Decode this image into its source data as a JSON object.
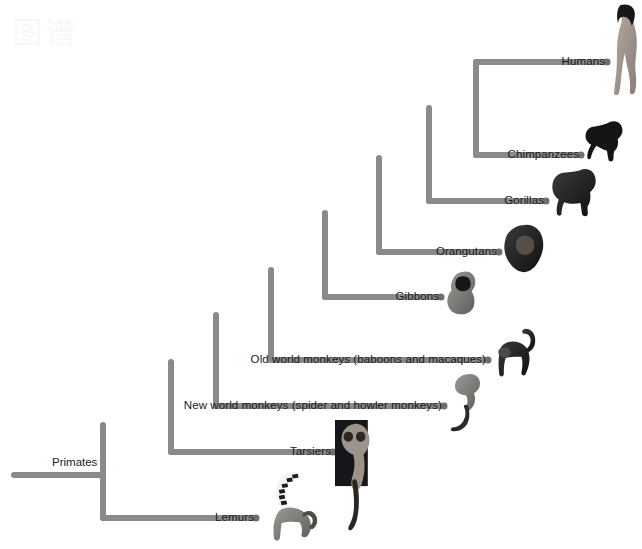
{
  "figure": {
    "type": "phylogenetic-tree",
    "subject": "Primates",
    "root_label": "Primates",
    "background_color": "#ffffff",
    "branch_color": "#8a8a8a",
    "branch_tip_dot_color": "#6f6f6f",
    "label_color": "#1b1b1b",
    "branch_width_px": 6
  },
  "tips": [
    {
      "id": "humans",
      "label": "Humans",
      "label_x": 605,
      "label_y": 56,
      "branch_y": 62,
      "branch_start_x": 476,
      "branch_end_x": 607,
      "image": "human-silhouette",
      "image_x": 609,
      "image_y": 4,
      "image_w": 30,
      "image_h": 92
    },
    {
      "id": "chimpanzees",
      "label": "Chimpanzees",
      "label_x": 579,
      "label_y": 149,
      "branch_y": 155,
      "branch_start_x": 476,
      "branch_end_x": 581,
      "image": "chimpanzee-silhouette",
      "image_x": 583,
      "image_y": 118,
      "image_w": 42,
      "image_h": 44
    },
    {
      "id": "gorillas",
      "label": "Gorillas",
      "label_x": 544,
      "label_y": 195,
      "branch_y": 201,
      "branch_start_x": 429,
      "branch_end_x": 546,
      "image": "gorilla-silhouette",
      "image_x": 548,
      "image_y": 164,
      "image_w": 52,
      "image_h": 54
    },
    {
      "id": "orangutans",
      "label": "Orangutans",
      "label_x": 497,
      "label_y": 246,
      "branch_y": 252,
      "branch_start_x": 379,
      "branch_end_x": 499,
      "image": "orangutan-silhouette",
      "image_x": 501,
      "image_y": 222,
      "image_w": 48,
      "image_h": 56
    },
    {
      "id": "gibbons",
      "label": "Gibbons",
      "label_x": 439,
      "label_y": 291,
      "branch_y": 297,
      "branch_start_x": 325,
      "branch_end_x": 441,
      "image": "gibbon-silhouette",
      "image_x": 443,
      "image_y": 268,
      "image_w": 40,
      "image_h": 50
    },
    {
      "id": "old-world-monkeys",
      "label": "Old world monkeys (baboons and macaques)",
      "label_x": 486,
      "label_y": 354,
      "branch_y": 360,
      "branch_start_x": 271,
      "branch_end_x": 488,
      "image": "baboon-silhouette",
      "image_x": 490,
      "image_y": 325,
      "image_w": 48,
      "image_h": 56
    },
    {
      "id": "new-world-monkeys",
      "label": "New world monkeys (spider and howler monkeys)",
      "label_x": 442,
      "label_y": 400,
      "branch_y": 406,
      "branch_start_x": 216,
      "branch_end_x": 444,
      "image": "spider-monkey-silhouette",
      "image_x": 446,
      "image_y": 370,
      "image_w": 44,
      "image_h": 66
    },
    {
      "id": "tarsiers",
      "label": "Tarsiers",
      "label_x": 331,
      "label_y": 446,
      "branch_y": 452,
      "branch_start_x": 171,
      "branch_end_x": 333,
      "image": "tarsier-photo",
      "image_x": 335,
      "image_y": 420,
      "image_w": 40,
      "image_h": 118
    },
    {
      "id": "lemurs",
      "label": "Lemurs",
      "label_x": 254,
      "label_y": 512,
      "branch_y": 518,
      "branch_start_x": 103,
      "branch_end_x": 256,
      "image": "ring-tailed-lemur-silhouette",
      "image_x": 258,
      "image_y": 470,
      "image_w": 66,
      "image_h": 76
    }
  ],
  "nodes": [
    {
      "id": "node-primates",
      "x": 103,
      "top_y": 425,
      "bottom_y": 518,
      "parent_y": 475
    },
    {
      "id": "node-haplorhini",
      "x": 171,
      "top_y": 362,
      "bottom_y": 452,
      "parent_y": 425
    },
    {
      "id": "node-simians",
      "x": 216,
      "top_y": 315,
      "bottom_y": 406,
      "parent_y": 362
    },
    {
      "id": "node-catarrhini",
      "x": 271,
      "top_y": 270,
      "bottom_y": 360,
      "parent_y": 315
    },
    {
      "id": "node-hominoids",
      "x": 325,
      "top_y": 213,
      "bottom_y": 297,
      "parent_y": 270
    },
    {
      "id": "node-great-apes",
      "x": 379,
      "top_y": 158,
      "bottom_y": 252,
      "parent_y": 213
    },
    {
      "id": "node-homininae",
      "x": 429,
      "top_y": 108,
      "bottom_y": 201,
      "parent_y": 158
    },
    {
      "id": "node-hominini",
      "x": 476,
      "top_y": 62,
      "bottom_y": 155,
      "parent_y": 108
    }
  ],
  "root": {
    "label": "Primates",
    "label_x": 52,
    "label_y": 457,
    "line_start_x": 14,
    "line_end_x": 103,
    "line_y": 475
  },
  "watermark": {
    "text": "图谱"
  }
}
